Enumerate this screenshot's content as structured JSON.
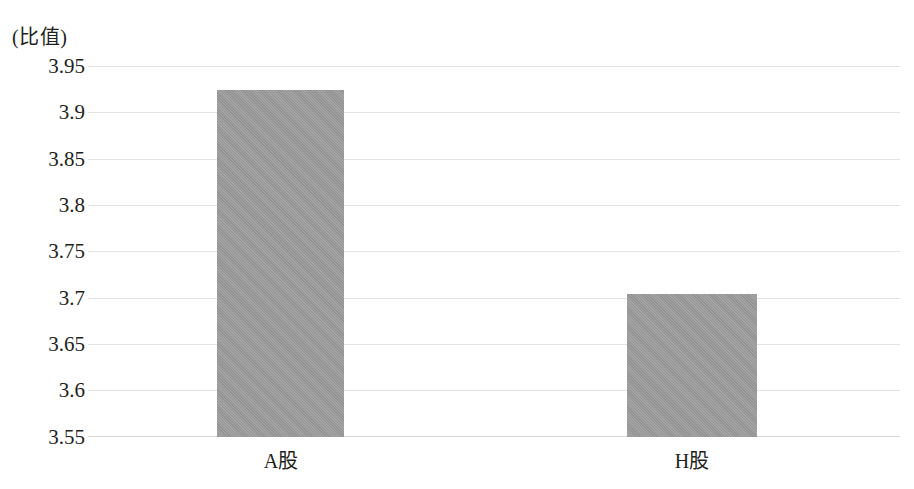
{
  "chart_data": {
    "type": "bar",
    "title": "",
    "subtitle": "",
    "xlabel": "",
    "ylabel": "(比值)",
    "unit_caption": "(比值)",
    "categories": [
      "A股",
      "H股"
    ],
    "values": [
      3.925,
      3.705
    ],
    "series": [
      {
        "name": "比值",
        "values": [
          3.925,
          3.705
        ]
      }
    ],
    "ylim": [
      3.55,
      3.95
    ],
    "ytick_step": 0.05,
    "ytick_labels": [
      "3.95",
      "3.9",
      "3.85",
      "3.8",
      "3.75",
      "3.7",
      "3.65",
      "3.6",
      "3.55"
    ],
    "ytick_values": [
      3.95,
      3.9,
      3.85,
      3.8,
      3.75,
      3.7,
      3.65,
      3.6,
      3.55
    ],
    "grid": true,
    "grid_axis": "y",
    "legend": false,
    "legend_position": "none",
    "annotations": [],
    "colors": {
      "bar_fill": "#9b9b9b",
      "gridline": "#e3e3e3",
      "baseline": "#d8d8d8",
      "text": "#231f20",
      "background": "#ffffff"
    }
  }
}
